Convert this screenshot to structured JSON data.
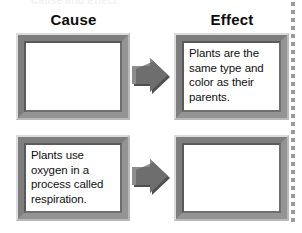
{
  "page": {
    "title_sliver": "Cause and Effect",
    "background_color": "#ffffff",
    "frame_border_color": "#8a8a8a",
    "frame_inner_line_color": "#5a5a5a",
    "arrow_color": "#6e6e6e",
    "arrow_shadow_color": "#4a4a4a",
    "cut_line_color": "#9a9a9a",
    "text_color": "#101010"
  },
  "headings": {
    "cause": "Cause",
    "effect": "Effect"
  },
  "rows": [
    {
      "cause": {
        "text": "",
        "filled": false,
        "name": "cause-box-1"
      },
      "arrow": {
        "icon": "right-arrow-icon",
        "name": "arrow-row-1"
      },
      "effect": {
        "text": "Plants are the same type and color as their parents.",
        "filled": true,
        "name": "effect-box-1"
      }
    },
    {
      "cause": {
        "text": "Plants use oxygen in a process called respiration.",
        "filled": true,
        "name": "cause-box-2"
      },
      "arrow": {
        "icon": "right-arrow-icon",
        "name": "arrow-row-2"
      },
      "effect": {
        "text": "",
        "filled": false,
        "name": "effect-box-2"
      }
    }
  ],
  "cut_line": {
    "icon": "dotted-cut-line",
    "dot_count": 28,
    "dot_spacing_px": 8
  }
}
